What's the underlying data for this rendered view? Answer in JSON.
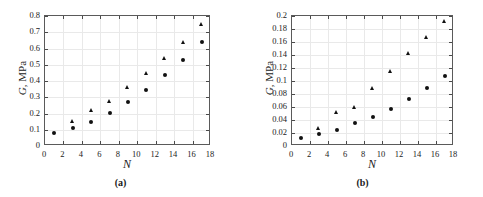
{
  "figure": {
    "panels": [
      {
        "tag": "(a)",
        "xlabel": "N",
        "ylabel_var": "G",
        "ylabel_rest": ", MPa"
      },
      {
        "tag": "(b)",
        "xlabel": "N",
        "ylabel_var": "G",
        "ylabel_rest": ", MPa"
      }
    ]
  },
  "chart_data": [
    {
      "type": "scatter",
      "panel": "(a)",
      "title": "",
      "xlabel": "N",
      "ylabel": "G, MPa",
      "xlim": [
        0,
        18
      ],
      "ylim": [
        0,
        0.8
      ],
      "xticks": [
        0,
        2,
        4,
        6,
        8,
        10,
        12,
        14,
        16,
        18
      ],
      "xticklabels": [
        "0",
        "2",
        "4",
        "6",
        "8",
        "10",
        "12",
        "14",
        "16",
        "18"
      ],
      "yticks": [
        0,
        0.1,
        0.2,
        0.3,
        0.4,
        0.5,
        0.6,
        0.7,
        0.8
      ],
      "yticklabels": [
        "0",
        "0.1",
        "0.2",
        "0.3",
        "0.4",
        "0.5",
        "0.6",
        "0.7",
        "0.8"
      ],
      "grid": true,
      "legend": "none",
      "series": [
        {
          "name": "triangle-series",
          "marker": "triangle",
          "color": "#111111",
          "x": [
            3,
            5,
            7,
            9,
            11,
            13,
            15,
            17
          ],
          "values": [
            0.148,
            0.218,
            0.272,
            0.358,
            0.445,
            0.539,
            0.638,
            0.75
          ]
        },
        {
          "name": "circle-series",
          "marker": "circle",
          "color": "#111111",
          "x": [
            1,
            3,
            5,
            7,
            9,
            11,
            13,
            15,
            17
          ],
          "values": [
            0.078,
            0.11,
            0.15,
            0.204,
            0.27,
            0.346,
            0.436,
            0.531,
            0.638
          ]
        }
      ]
    },
    {
      "type": "scatter",
      "panel": "(b)",
      "title": "",
      "xlabel": "N",
      "ylabel": "G, MPa",
      "xlim": [
        0,
        18
      ],
      "ylim": [
        0,
        0.2
      ],
      "xticks": [
        0,
        2,
        4,
        6,
        8,
        10,
        12,
        14,
        16,
        18
      ],
      "xticklabels": [
        "0",
        "2",
        "4",
        "6",
        "8",
        "10",
        "12",
        "14",
        "16",
        "18"
      ],
      "yticks": [
        0,
        0.02,
        0.04,
        0.06,
        0.08,
        0.1,
        0.12,
        0.14,
        0.16,
        0.18,
        0.2
      ],
      "yticklabels": [
        "0",
        "0.02",
        "0.04",
        "0.06",
        "0.08",
        "0.1",
        "0.12",
        "0.14",
        "0.16",
        "0.18",
        "0.2"
      ],
      "grid": true,
      "legend": "none",
      "series": [
        {
          "name": "triangle-series",
          "marker": "triangle",
          "color": "#111111",
          "x": [
            3,
            5,
            7,
            9,
            11,
            13,
            15,
            17
          ],
          "values": [
            0.027,
            0.051,
            0.059,
            0.088,
            0.115,
            0.142,
            0.167,
            0.192
          ]
        },
        {
          "name": "circle-series",
          "marker": "circle",
          "color": "#111111",
          "x": [
            1,
            3,
            5,
            7,
            9,
            11,
            13,
            15,
            17
          ],
          "values": [
            0.013,
            0.018,
            0.025,
            0.035,
            0.045,
            0.057,
            0.073,
            0.089,
            0.107
          ]
        }
      ]
    }
  ]
}
